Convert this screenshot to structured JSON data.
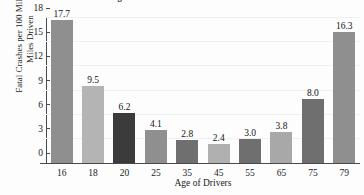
{
  "chart_data": {
    "type": "bar",
    "title": "Age of Bad Drivers and Fatal Crashes",
    "xlabel": "Age of Drivers",
    "ylabel_lines": [
      "Fatal Crashes per 100 Million",
      "Miles Driven"
    ],
    "categories": [
      "16",
      "18",
      "20",
      "25",
      "35",
      "45",
      "55",
      "65",
      "75",
      "79"
    ],
    "values": [
      17.7,
      9.5,
      6.2,
      4.1,
      2.8,
      2.4,
      3.0,
      3.8,
      8.0,
      16.3
    ],
    "value_labels": [
      "17.7",
      "9.5",
      "6.2",
      "4.1",
      "2.8",
      "2.4",
      "3.0",
      "3.8",
      "8.0",
      "16.3"
    ],
    "bar_colors": [
      "#8f8f8f",
      "#b4b4b4",
      "#3b3b3b",
      "#8f8f8f",
      "#6f6f6f",
      "#b0b0b0",
      "#6f6f6f",
      "#a8a8a8",
      "#6f6f6f",
      "#8f8f8f"
    ],
    "ylim": [
      0,
      18
    ],
    "yticks": [
      0,
      3,
      6,
      9,
      12,
      15,
      18
    ],
    "ytick_labels": [
      "0",
      "3",
      "6",
      "9",
      "12",
      "15",
      "18"
    ],
    "grid": true,
    "legend": "none"
  }
}
